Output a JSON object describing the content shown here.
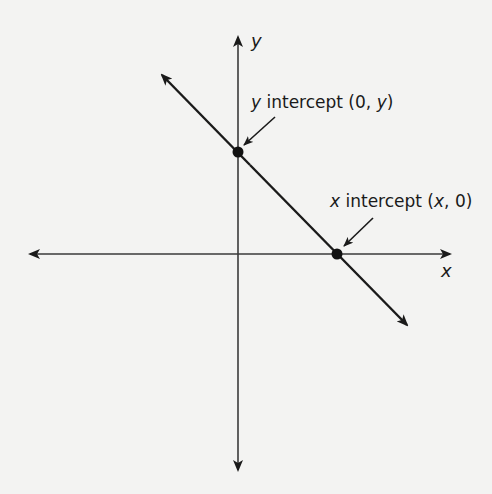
{
  "diagram": {
    "title": "",
    "axes": {
      "x_label": "x",
      "y_label": "y",
      "origin_px": [
        238,
        254
      ]
    },
    "line": {
      "from_px": [
        162,
        75
      ],
      "to_px": [
        407,
        325
      ],
      "description": "line with negative slope, arrowheads at both ends"
    },
    "points": [
      {
        "name": "y-intercept",
        "px": [
          238,
          152
        ]
      },
      {
        "name": "x-intercept",
        "px": [
          337,
          254
        ]
      }
    ],
    "annotations": {
      "y_intercept": {
        "var": "y",
        "text": " intercept (0, ",
        "var2": "y",
        "close": ")"
      },
      "x_intercept": {
        "var": "x",
        "text": " intercept (",
        "var2": "x",
        "close": ", 0)"
      }
    },
    "colors": {
      "ink": "#1a1a1a",
      "axis": "#3a3a3a",
      "background": "#f3f3f2"
    }
  }
}
